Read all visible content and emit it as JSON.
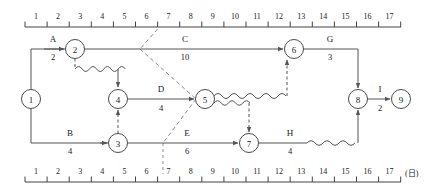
{
  "diagram": {
    "type": "arrow-diagram-time-scale",
    "unit_label": "(日)",
    "scales": {
      "top": {
        "ticks": [
          "1",
          "2",
          "3",
          "4",
          "5",
          "6",
          "7",
          "8",
          "9",
          "10",
          "11",
          "12",
          "13",
          "14",
          "15",
          "16",
          "17"
        ],
        "x_start": 25,
        "x_end": 401,
        "y": 27
      },
      "bottom": {
        "ticks": [
          "1",
          "2",
          "3",
          "4",
          "5",
          "6",
          "7",
          "8",
          "9",
          "10",
          "11",
          "12",
          "13",
          "14",
          "15",
          "16",
          "17"
        ],
        "x_start": 25,
        "x_end": 401,
        "y": 176
      }
    },
    "nodes": [
      {
        "id": "n1",
        "label": "1",
        "cx": 31,
        "cy": 99,
        "r": 9.5
      },
      {
        "id": "n2",
        "label": "2",
        "cx": 75,
        "cy": 49,
        "r": 9.5
      },
      {
        "id": "n3",
        "label": "3",
        "cx": 118,
        "cy": 143,
        "r": 9.5
      },
      {
        "id": "n4",
        "label": "4",
        "cx": 118,
        "cy": 99,
        "r": 9.5
      },
      {
        "id": "n5",
        "label": "5",
        "cx": 205,
        "cy": 99,
        "r": 9.5
      },
      {
        "id": "n6",
        "label": "6",
        "cx": 294,
        "cy": 49,
        "r": 9.5
      },
      {
        "id": "n7",
        "label": "7",
        "cx": 249,
        "cy": 143,
        "r": 9.5
      },
      {
        "id": "n8",
        "label": "8",
        "cx": 358,
        "cy": 99,
        "r": 9.5
      },
      {
        "id": "n9",
        "label": "9",
        "cx": 401,
        "cy": 99,
        "r": 9.5
      }
    ],
    "activities": [
      {
        "id": "A",
        "name": "A",
        "duration": "2",
        "from": "1",
        "to": "2",
        "name_x": 53,
        "name_y": 42,
        "dur_x": 53,
        "dur_y": 59
      },
      {
        "id": "C",
        "name": "C",
        "duration": "10",
        "from": "2",
        "to": "6",
        "name_x": 185,
        "name_y": 42,
        "dur_x": 185,
        "dur_y": 59
      },
      {
        "id": "G",
        "name": "G",
        "duration": "3",
        "from": "6",
        "to": "8",
        "name_x": 330,
        "name_y": 42,
        "dur_x": 330,
        "dur_y": 59
      },
      {
        "id": "D",
        "name": "D",
        "duration": "4",
        "from": "4",
        "to": "5",
        "name_x": 161,
        "name_y": 92,
        "dur_x": 161,
        "dur_y": 110
      },
      {
        "id": "I",
        "name": "I",
        "duration": "2",
        "from": "8",
        "to": "9",
        "name_x": 380,
        "name_y": 92,
        "dur_x": 380,
        "dur_y": 110
      },
      {
        "id": "B",
        "name": "B",
        "duration": "4",
        "from": "1",
        "to": "3",
        "name_x": 70,
        "name_y": 136,
        "dur_x": 70,
        "dur_y": 153
      },
      {
        "id": "E",
        "name": "E",
        "duration": "6",
        "from": "3",
        "to": "7",
        "name_x": 187,
        "name_y": 136,
        "dur_x": 187,
        "dur_y": 153
      },
      {
        "id": "H",
        "name": "H",
        "duration": "4",
        "from": "7",
        "to": "8",
        "name_x": 290,
        "name_y": 136,
        "dur_x": 290,
        "dur_y": 153
      }
    ],
    "dummy_links": [
      {
        "id": "d2-4",
        "from": "2",
        "to": "4",
        "note": "dummy with float wave"
      },
      {
        "id": "d3-4",
        "from": "3",
        "to": "4",
        "note": "vertical dummy"
      },
      {
        "id": "d5-6",
        "from": "5",
        "to": "6",
        "note": "dummy with float wave"
      },
      {
        "id": "d5-7",
        "from": "5",
        "to": "7",
        "note": "dummy with float wave"
      }
    ],
    "float_waves": [
      {
        "id": "w2-4",
        "note": "free float between node 2 and node 4"
      },
      {
        "id": "w5-6",
        "note": "free float on path to node 6"
      },
      {
        "id": "w5-7",
        "note": "free float on path to node 7"
      },
      {
        "id": "wH",
        "note": "free float at end of activity H"
      }
    ],
    "guide": {
      "note": "critical-boundary guide line from top scale day 6-7 through diagram to bottom scale day 6-7"
    },
    "colors": {
      "stroke": "#555555",
      "node_stroke": "#4a4a4a",
      "text": "#1a1a1a",
      "guide": "#8a8a8a",
      "background": "#ffffff"
    }
  }
}
